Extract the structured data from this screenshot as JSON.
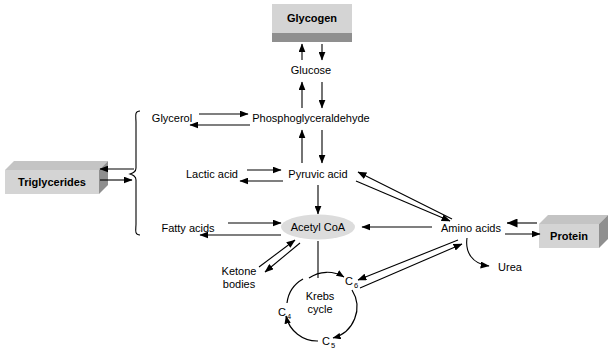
{
  "diagram": {
    "type": "metabolic-pathway-flow-diagram",
    "colors": {
      "box_face": "#d4d4d4",
      "box_shadow": "#8f8f8f",
      "ellipse_fill": "#dcdcdc",
      "stroke": "#000000",
      "background": "#ffffff"
    },
    "nodes": {
      "glycogen": {
        "label": "Glycogen",
        "shape": "3d-box",
        "style": "bold",
        "x": 311,
        "y": 16
      },
      "glucose": {
        "label": "Glucose",
        "shape": "text",
        "x": 311,
        "y": 70
      },
      "glycerol": {
        "label": "Glycerol",
        "shape": "text",
        "x": 172,
        "y": 118
      },
      "phosphoglyceraldehyde": {
        "label": "Phosphoglyceraldehyde",
        "shape": "text",
        "x": 311,
        "y": 118
      },
      "lactic_acid": {
        "label": "Lactic acid",
        "shape": "text",
        "x": 212,
        "y": 174
      },
      "pyruvic_acid": {
        "label": "Pyruvic acid",
        "shape": "text",
        "x": 318,
        "y": 174
      },
      "triglycerides": {
        "label": "Triglycerides",
        "shape": "3d-box",
        "style": "bold",
        "x": 52,
        "y": 174
      },
      "fatty_acids": {
        "label": "Fatty acids",
        "shape": "text",
        "x": 188,
        "y": 228
      },
      "acetyl_coa": {
        "label": "Acetyl CoA",
        "shape": "ellipse",
        "x": 318,
        "y": 227
      },
      "amino_acids": {
        "label": "Amino acids",
        "shape": "text",
        "x": 471,
        "y": 228
      },
      "protein": {
        "label": "Protein",
        "shape": "3d-box",
        "style": "bold",
        "x": 573,
        "y": 228
      },
      "ketone_bodies": {
        "label": "Ketone bodies",
        "line1": "Ketone",
        "line2": "bodies",
        "shape": "text",
        "x": 239,
        "y": 278
      },
      "urea": {
        "label": "Urea",
        "shape": "text",
        "x": 510,
        "y": 267
      },
      "krebs_cycle": {
        "label": "Krebs cycle",
        "line1": "Krebs",
        "line2": "cycle",
        "shape": "text",
        "x": 320,
        "y": 302
      },
      "c6": {
        "label": "C6",
        "base": "C",
        "sub": "6",
        "shape": "text",
        "x": 350,
        "y": 282
      },
      "c5": {
        "label": "C5",
        "base": "C",
        "sub": "5",
        "shape": "text",
        "x": 327,
        "y": 342
      },
      "c4": {
        "label": "C4",
        "base": "C",
        "sub": "4",
        "shape": "text",
        "x": 283,
        "y": 313
      }
    },
    "edges": [
      {
        "from": "glucose",
        "to": "glycogen",
        "direction": "up"
      },
      {
        "from": "glycogen",
        "to": "glucose",
        "direction": "down"
      },
      {
        "from": "phosphoglyceraldehyde",
        "to": "glucose",
        "direction": "up"
      },
      {
        "from": "glucose",
        "to": "phosphoglyceraldehyde",
        "direction": "down"
      },
      {
        "from": "glycerol",
        "to": "phosphoglyceraldehyde",
        "direction": "right"
      },
      {
        "from": "phosphoglyceraldehyde",
        "to": "glycerol",
        "direction": "left"
      },
      {
        "from": "pyruvic_acid",
        "to": "phosphoglyceraldehyde",
        "direction": "up"
      },
      {
        "from": "phosphoglyceraldehyde",
        "to": "pyruvic_acid",
        "direction": "down"
      },
      {
        "from": "lactic_acid",
        "to": "pyruvic_acid",
        "direction": "right"
      },
      {
        "from": "pyruvic_acid",
        "to": "lactic_acid",
        "direction": "left"
      },
      {
        "from": "pyruvic_acid",
        "to": "acetyl_coa",
        "direction": "down"
      },
      {
        "from": "fatty_acids",
        "to": "acetyl_coa",
        "direction": "right"
      },
      {
        "from": "acetyl_coa",
        "to": "fatty_acids",
        "direction": "left"
      },
      {
        "from": "brace",
        "to": "triglycerides",
        "direction": "left"
      },
      {
        "from": "triglycerides",
        "to": "brace",
        "direction": "right"
      },
      {
        "from": "amino_acids",
        "to": "acetyl_coa",
        "direction": "left"
      },
      {
        "from": "protein",
        "to": "amino_acids",
        "direction": "left"
      },
      {
        "from": "amino_acids",
        "to": "protein",
        "direction": "right"
      },
      {
        "from": "amino_acids",
        "to": "pyruvic_acid",
        "direction": "diagonal-up-left"
      },
      {
        "from": "pyruvic_acid",
        "to": "amino_acids",
        "direction": "diagonal-down-right"
      },
      {
        "from": "amino_acids",
        "to": "c6",
        "direction": "diagonal-down-left"
      },
      {
        "from": "c6",
        "to": "amino_acids",
        "direction": "diagonal-up-right"
      },
      {
        "from": "ketone_bodies",
        "to": "acetyl_coa",
        "direction": "diagonal-up-right"
      },
      {
        "from": "acetyl_coa",
        "to": "ketone_bodies",
        "direction": "diagonal-down-left"
      },
      {
        "from": "amino_acids",
        "to": "urea",
        "direction": "curved-down"
      },
      {
        "from": "acetyl_coa",
        "to": "c6",
        "direction": "cycle-entry"
      },
      {
        "from": "c6",
        "to": "c5",
        "direction": "cycle-arc"
      },
      {
        "from": "c5",
        "to": "c4",
        "direction": "cycle-arc"
      },
      {
        "from": "c4",
        "to": "c6",
        "direction": "cycle-arc"
      }
    ]
  }
}
